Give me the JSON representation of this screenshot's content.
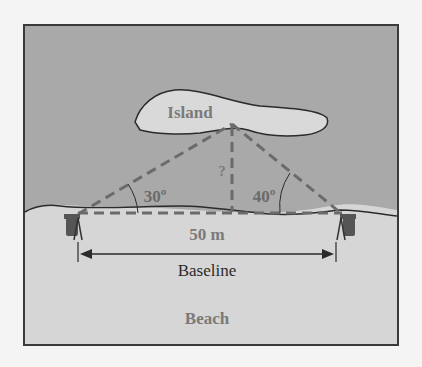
{
  "labels": {
    "island": "Island",
    "unknown_height": "?",
    "angle_left": "30º",
    "angle_right": "40º",
    "distance": "50 m",
    "baseline": "Baseline",
    "beach": "Beach"
  },
  "colors": {
    "water": "#a9a9a9",
    "beach": "#d6d6d6",
    "island": "#d9d9d9",
    "frame": "#3a3a3a",
    "dashed": "#6b6b6b",
    "label_gray": "#7a7a7a",
    "label_dark": "#2b2b2b"
  },
  "geometry": {
    "baseline_length_m": 50,
    "angle_left_deg": 30,
    "angle_right_deg": 40
  }
}
